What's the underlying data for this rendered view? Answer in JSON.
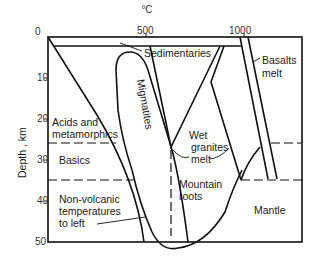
{
  "diagram": {
    "x_axis": {
      "unit": "°C",
      "ticks": [
        "0",
        "500",
        "1000"
      ]
    },
    "y_axis": {
      "label": "Depth , km",
      "ticks": [
        "0",
        "10",
        "20",
        "30",
        "40",
        "50"
      ]
    },
    "labels": {
      "sedimentaries": "Sedimentaries",
      "basalts_1": "Basalts",
      "basalts_2": "melt",
      "migmatites": "Migmatites",
      "acids_1": "Acids and",
      "acids_2": "metamorphics",
      "basics": "Basics",
      "wet_1": "Wet",
      "wet_2": "granites",
      "wet_3": "melt",
      "mountain_1": "Mountain",
      "mountain_2": "roots",
      "mantle": "Mantle",
      "nonvolc_1": "Non-volcanic",
      "nonvolc_2": "temperatures",
      "nonvolc_3": "to left"
    }
  }
}
